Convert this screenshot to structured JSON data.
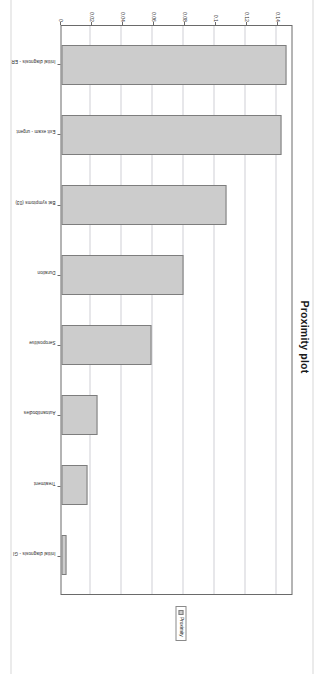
{
  "chart_data": {
    "type": "bar",
    "title": "Proximity plot",
    "xlabel": "",
    "ylabel": "",
    "ylim": [
      0,
      0.15
    ],
    "grid": true,
    "legend_position": "right",
    "legend": [
      "Proximity"
    ],
    "yticks": [
      "0",
      "0.02",
      "0.04",
      "0.06",
      "0.08",
      "0.1",
      "0.12",
      "0.14"
    ],
    "ytick_values": [
      0,
      0.02,
      0.04,
      0.06,
      0.08,
      0.1,
      0.12,
      0.14
    ],
    "categories": [
      "Initial diagnosis - ER",
      "Exit exam - urgent",
      "Bat symptoms (03)",
      "Duration",
      "Seropositive",
      "Autoantibodies",
      "Treatment",
      "Initial diagnosis - GI"
    ],
    "values": [
      0.1455,
      0.142,
      0.107,
      0.079,
      0.058,
      0.023,
      0.0165,
      0.0035
    ],
    "series": [
      {
        "name": "Proximity",
        "values": [
          0.1455,
          0.142,
          0.107,
          0.079,
          0.058,
          0.023,
          0.0165,
          0.0035
        ]
      }
    ],
    "colors": {
      "bar_fill": "#cccccc",
      "bar_stroke": "#7d7d7d",
      "grid": "#cfcfd6",
      "frame": "#6a6a6a",
      "text": "#222222"
    }
  }
}
